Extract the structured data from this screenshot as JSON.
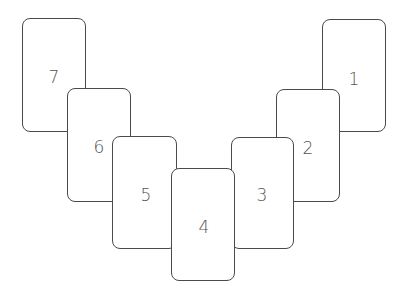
{
  "diagram": {
    "cards": [
      {
        "label": "1",
        "x": 322,
        "y": 19,
        "w": 64,
        "h": 113,
        "z": 1,
        "lx": 353,
        "ly": 78
      },
      {
        "label": "2",
        "x": 276,
        "y": 89,
        "w": 64,
        "h": 113,
        "z": 2,
        "lx": 307,
        "ly": 147
      },
      {
        "label": "3",
        "x": 231,
        "y": 137,
        "w": 63,
        "h": 112,
        "z": 3,
        "lx": 261,
        "ly": 194
      },
      {
        "label": "4",
        "x": 171,
        "y": 168,
        "w": 64,
        "h": 113,
        "z": 4,
        "lx": 203,
        "ly": 226
      },
      {
        "label": "5",
        "x": 112,
        "y": 136,
        "w": 65,
        "h": 113,
        "z": 3,
        "lx": 145,
        "ly": 194
      },
      {
        "label": "6",
        "x": 67,
        "y": 88,
        "w": 64,
        "h": 114,
        "z": 2,
        "lx": 98,
        "ly": 146
      },
      {
        "label": "7",
        "x": 22,
        "y": 18,
        "w": 64,
        "h": 114,
        "z": 1,
        "lx": 53,
        "ly": 76
      }
    ]
  }
}
